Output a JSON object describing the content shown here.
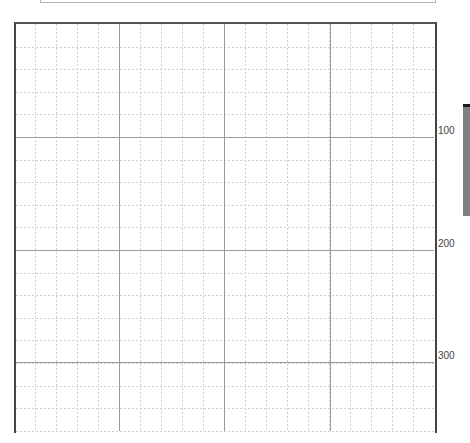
{
  "grid": {
    "major_x_positions": [
      119,
      224,
      330
    ],
    "major_y_positions": [
      137,
      250,
      362
    ],
    "minor_cells_per_major": 5,
    "colors": {
      "frame": "#444444",
      "major_line": "#9a9a9a",
      "minor_line": "#cfcfcf"
    }
  },
  "y_axis": {
    "labels": [
      {
        "value": "100",
        "y": 131
      },
      {
        "value": "200",
        "y": 244
      },
      {
        "value": "300",
        "y": 356
      }
    ]
  },
  "side_bar": {
    "color": "#808080",
    "top_color": "#1a1a1a"
  }
}
